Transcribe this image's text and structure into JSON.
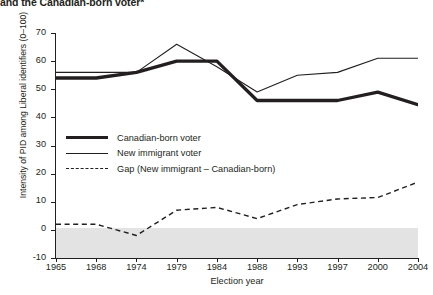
{
  "title": "and the Canadian-born voter*",
  "axis": {
    "xlabel": "Election year",
    "ylabel": "Intensity of PID among Liberal identifiers (0–100)"
  },
  "legend": [
    {
      "label": "Canadian-born voter",
      "style": "thick-solid"
    },
    {
      "label": "New immigrant voter",
      "style": "thin-solid"
    },
    {
      "label": "Gap (New immigrant – Canadian-born)",
      "style": "dashed"
    }
  ],
  "yticks": [
    "70",
    "60",
    "50",
    "40",
    "30",
    "20",
    "10",
    "0",
    "-10"
  ],
  "xticks": [
    "1965",
    "1968",
    "1974",
    "1979",
    "1984",
    "1988",
    "1993",
    "1997",
    "2000",
    "2004"
  ],
  "chart_data": {
    "type": "line",
    "title": "and the Canadian-born voter*",
    "xlabel": "Election year",
    "ylabel": "Intensity of PID among Liberal identifiers (0–100)",
    "categories": [
      "1965",
      "1968",
      "1974",
      "1979",
      "1984",
      "1988",
      "1993",
      "1997",
      "2000",
      "2004"
    ],
    "ylim": [
      -10,
      70
    ],
    "yticks": [
      -10,
      0,
      10,
      20,
      30,
      40,
      50,
      60,
      70
    ],
    "grid": false,
    "legend_position": "inside-left",
    "shaded_region": {
      "from": -10,
      "to": 0,
      "color": "#e3e3e3"
    },
    "series": [
      {
        "name": "Canadian-born voter",
        "style": "thick-solid",
        "color": "#231f20",
        "values": [
          54,
          54,
          56,
          60,
          60,
          46,
          46,
          46,
          49,
          44.5
        ]
      },
      {
        "name": "New immigrant voter",
        "style": "thin-solid",
        "color": "#231f20",
        "values": [
          56,
          56,
          56,
          66,
          58,
          49,
          55,
          56,
          61,
          61
        ]
      },
      {
        "name": "Gap (New immigrant – Canadian-born)",
        "style": "dashed",
        "color": "#231f20",
        "values": [
          2,
          2,
          -2,
          7,
          8,
          4,
          9,
          11,
          11.5,
          17
        ]
      }
    ]
  }
}
